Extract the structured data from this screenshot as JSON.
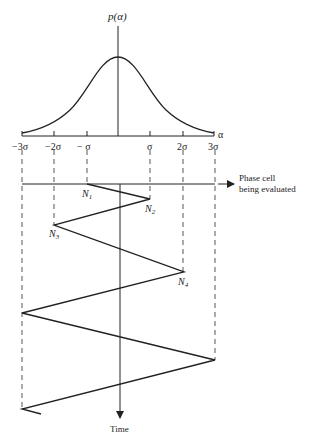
{
  "diagram": {
    "y_axis_label": "p(α)",
    "x_axis_label": "α",
    "ticks": [
      "−3σ",
      "−2σ",
      "− σ",
      "σ",
      "2σ",
      "3σ"
    ],
    "phase_cell_label_line1": "Phase cell",
    "phase_cell_label_line2": "being evaluated",
    "time_label": "Time",
    "nodes": [
      {
        "label": "N",
        "sub": "1"
      },
      {
        "label": "N",
        "sub": "2"
      },
      {
        "label": "N",
        "sub": "3"
      },
      {
        "label": "N",
        "sub": "4"
      }
    ],
    "colors": {
      "line": "#222222",
      "background": "#ffffff"
    }
  }
}
